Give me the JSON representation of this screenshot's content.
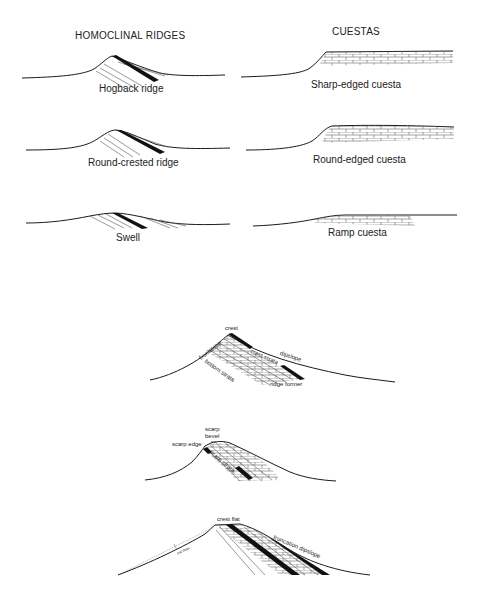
{
  "headers": {
    "left": "HOMOCLINAL RIDGES",
    "right": "CUESTAS"
  },
  "homoclinal_ridges": [
    {
      "label": "Hogback ridge"
    },
    {
      "label": "Round-crested ridge"
    },
    {
      "label": "Swell"
    }
  ],
  "cuestas": [
    {
      "label": "Sharp-edged cuesta"
    },
    {
      "label": "Round-edged cuesta"
    },
    {
      "label": "Ramp cuesta"
    }
  ],
  "detail_1": {
    "crest": "crest",
    "frontslope": "frontslope",
    "dipslope": "dipslope",
    "crest_strata": "crest strata",
    "bottom_strata": "bottom strata",
    "ridge_former": "ridge former"
  },
  "detail_2": {
    "scarp_bevel_line1": "scarp",
    "scarp_bevel_line2": "bevel",
    "scarp_edge": "scarp edge",
    "scarp_strata": "scarp strata"
  },
  "detail_3": {
    "crest_flat": "crest flat",
    "truncation_dipslope": "truncation dipslope",
    "small_label": "cw max"
  },
  "colors": {
    "line": "#1a1a1a",
    "hatch": "#555555",
    "background": "#ffffff"
  }
}
